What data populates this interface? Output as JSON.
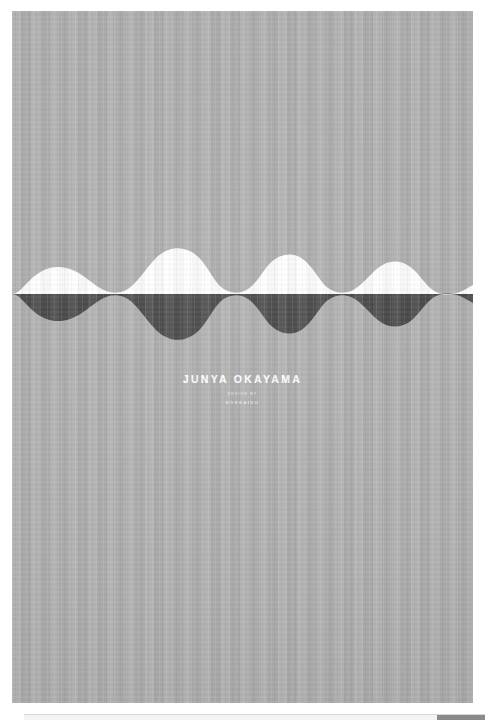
{
  "viewer": {
    "background_color": "#ffffff"
  },
  "poster": {
    "background_color": "#b0b0b0",
    "wave": {
      "name": "abstract-wave-graphic",
      "upper_color": "#ffffff",
      "lower_color": "#4a4a4a",
      "description": "mirrored scalloped wave band"
    },
    "credits": {
      "line_arch": "HOKKAIDO · SOUND LANDSCAPE",
      "name": "JUNYA OKAYAMA",
      "line_sub_a": "DESIGN BY",
      "line_sub_b": "HOKKAIDO",
      "text_color": "#ffffff"
    }
  },
  "scrollbar": {
    "track_color": "#f3f3f3",
    "thumb_color": "#8a8a8a"
  }
}
